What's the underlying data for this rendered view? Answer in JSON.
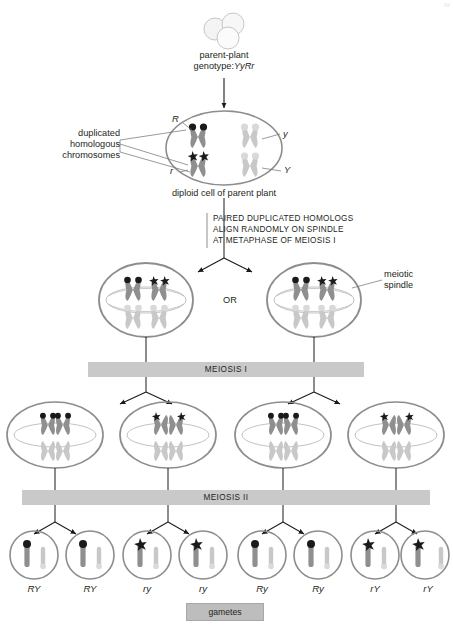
{
  "figure": {
    "corner_mark": "IV",
    "top": {
      "seeds_label_line1": "parent-plant",
      "seeds_label_line2": "genotype:",
      "seeds_genotype": "YyRr",
      "seed_icon": "pea-seeds-icon"
    },
    "diploid_cell": {
      "caption": "diploid cell of parent plant",
      "callout_line1": "duplicated",
      "callout_line2": "homologous",
      "callout_line3": "chromosomes",
      "alleles": {
        "top_left": "R",
        "top_right": "y",
        "bottom_left": "r",
        "bottom_right": "Y"
      }
    },
    "metaphase_note": {
      "line1": "PAIRED DUPLICATED HOMOLOGS",
      "line2": "ALIGN RANDOMLY ON SPINDLE",
      "line3": "AT METAPHASE OF MEIOSIS I"
    },
    "metaphase_stage": {
      "or_label": "OR",
      "spindle_label_line1": "meiotic",
      "spindle_label_line2": "spindle"
    },
    "bars": {
      "meiosis_one": "MEIOSIS I",
      "meiosis_two": "MEIOSIS II",
      "gametes": "gametes"
    },
    "gamete_labels": [
      "RY",
      "RY",
      "ry",
      "ry",
      "Ry",
      "Ry",
      "rY",
      "rY"
    ],
    "colors": {
      "bar_fill": "#c9c9c9",
      "gamete_bar_fill": "#bdbdbd",
      "chromosome_dark": "#8a8a8a",
      "chromosome_light": "#c4c4c4",
      "centromere_dark": "#1a1a1a",
      "cell_outline": "#8d8d8d",
      "text": "#231f20",
      "page_background": "#ffffff"
    }
  }
}
